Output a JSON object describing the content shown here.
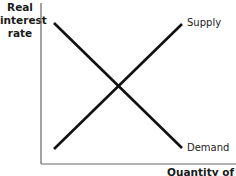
{
  "diagram": {
    "title": "",
    "y_axis_label": [
      "Real",
      "interest",
      "rate"
    ],
    "x_axis_label": "Quantity of",
    "curves": [
      {
        "name": "Supply",
        "label": "Supply",
        "slope": "upward",
        "from": [
          54,
          149
        ],
        "to": [
          182,
          24
        ]
      },
      {
        "name": "Demand",
        "label": "Demand",
        "slope": "downward",
        "from": [
          54,
          23
        ],
        "to": [
          182,
          148
        ]
      }
    ],
    "line_color": "#111111",
    "axis_color": "#555555"
  }
}
